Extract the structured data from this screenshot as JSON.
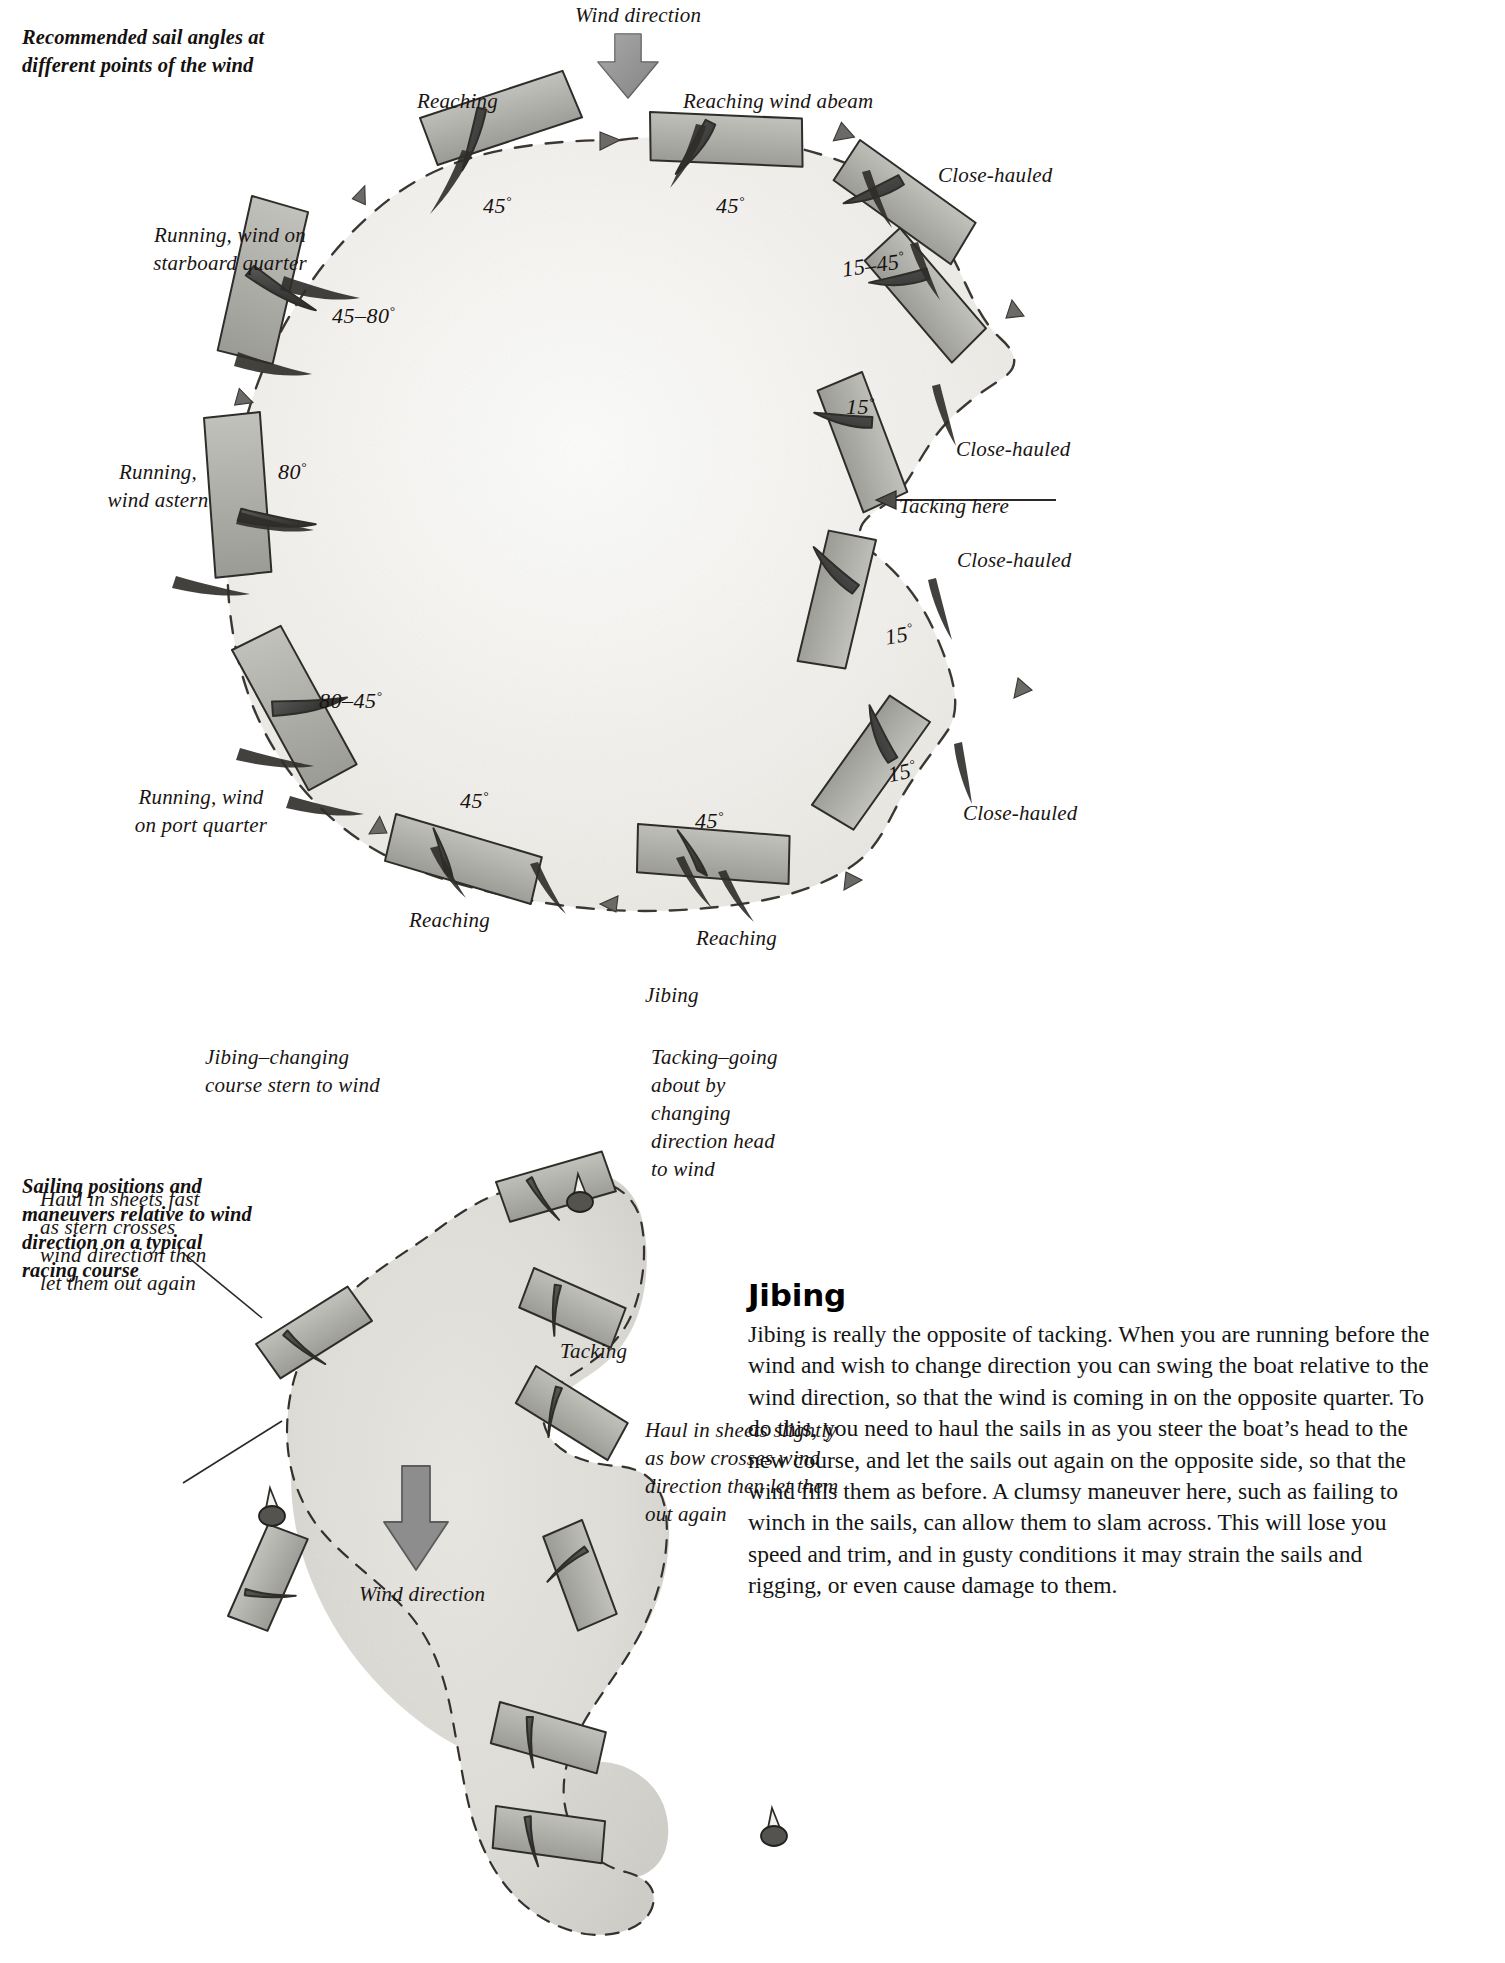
{
  "page": {
    "background": "#ffffff",
    "ink": "#1a1512",
    "sail_fill": "#9a9a9a",
    "hull_fill": "#b9b9b4",
    "arrow_fill": "#8e8e8e"
  },
  "figure1": {
    "caption": "Recommended sail angles at different points of the wind",
    "wind_label": "Wind direction",
    "labels": [
      {
        "key": "reaching_top_left",
        "text": "Reaching",
        "x": 417,
        "y": 87,
        "align": "left"
      },
      {
        "key": "reaching_wind_abeam",
        "text": "Reaching wind abeam",
        "x": 683,
        "y": 87,
        "align": "left"
      },
      {
        "key": "close_hauled_ne",
        "text": "Close-hauled",
        "x": 938,
        "y": 161,
        "align": "left"
      },
      {
        "key": "running_starboard",
        "text": "Running, wind on\nstarboard quarter",
        "x": 120,
        "y": 221,
        "align": "left"
      },
      {
        "key": "close_hauled_e",
        "text": "Close-hauled",
        "x": 956,
        "y": 435,
        "align": "left"
      },
      {
        "key": "tacking_here",
        "text": "Tacking here",
        "x": 899,
        "y": 492,
        "align": "left"
      },
      {
        "key": "close_hauled_se",
        "text": "Close-hauled",
        "x": 957,
        "y": 546,
        "align": "left"
      },
      {
        "key": "running_wind_astern",
        "text": "Running,\nwind astern",
        "x": 83,
        "y": 458,
        "align": "left"
      },
      {
        "key": "running_port",
        "text": "Running, wind\non port quarter",
        "x": 106,
        "y": 783,
        "align": "left"
      },
      {
        "key": "close_hauled_s",
        "text": "Close-hauled",
        "x": 963,
        "y": 799,
        "align": "left"
      },
      {
        "key": "reaching_bottom_left",
        "text": "Reaching",
        "x": 409,
        "y": 906,
        "align": "left"
      },
      {
        "key": "reaching_bottom_right",
        "text": "Reaching",
        "x": 696,
        "y": 924,
        "align": "left"
      }
    ],
    "angles": [
      {
        "key": "a45_top_left",
        "text": "45",
        "unit": "°",
        "x": 483,
        "y": 193
      },
      {
        "key": "a45_top_right",
        "text": "45",
        "unit": "°",
        "x": 716,
        "y": 193
      },
      {
        "key": "a15_45_ne",
        "text": "15–45",
        "unit": "°",
        "x": 842,
        "y": 252
      },
      {
        "key": "a45_80",
        "text": "45–80",
        "unit": "°",
        "x": 332,
        "y": 303
      },
      {
        "key": "a15_e",
        "text": "15",
        "unit": "°",
        "x": 846,
        "y": 394
      },
      {
        "key": "a80",
        "text": "80",
        "unit": "°",
        "x": 278,
        "y": 459
      },
      {
        "key": "a15_se",
        "text": "15",
        "unit": "°",
        "x": 885,
        "y": 622
      },
      {
        "key": "a80_45",
        "text": "80–45",
        "unit": "°",
        "x": 319,
        "y": 688
      },
      {
        "key": "a15_s",
        "text": "15",
        "unit": "°",
        "x": 888,
        "y": 759
      },
      {
        "key": "a45_bot_left",
        "text": "45",
        "unit": "°",
        "x": 460,
        "y": 788
      },
      {
        "key": "a45_bot_right",
        "text": "45",
        "unit": "°",
        "x": 695,
        "y": 808
      }
    ]
  },
  "figure2": {
    "caption": "Sailing positions and maneuvers relative to wind direction on a typical racing course",
    "wind_label": "Wind direction",
    "labels": [
      {
        "key": "jibing",
        "text": "Jibing",
        "x": 645,
        "y": 981,
        "align": "left"
      },
      {
        "key": "jibing_change",
        "text": "Jibing–changing\ncourse stern to wind",
        "x": 205,
        "y": 1043,
        "align": "left"
      },
      {
        "key": "tacking_going",
        "text": "Tacking–going\nabout by\nchanging\ndirection head\nto wind",
        "x": 651,
        "y": 1043,
        "align": "left"
      },
      {
        "key": "haul_fast",
        "text": "Haul in sheets fast\nas stern crosses\nwind direction then\nlet them out again",
        "x": 40,
        "y": 1185,
        "align": "left"
      },
      {
        "key": "tacking",
        "text": "Tacking",
        "x": 560,
        "y": 1337,
        "align": "left"
      },
      {
        "key": "haul_slightly",
        "text": "Haul in sheets slightly\nas bow crosses wind\ndirection then let them\nout again",
        "x": 645,
        "y": 1416,
        "align": "left"
      }
    ]
  },
  "article": {
    "heading": "Jibing",
    "body": "Jibing is really the opposite of tacking. When you are running before the wind and wish to change direction you can swing the boat relative to the wind direction, so that the wind is coming in on the opposite quarter. To do this, you need to haul the sails in as you steer the boat’s head to the new course, and let the sails out again on the opposite side, so that the wind fills them as before. A clumsy maneuver here, such as failing to winch in the sails, can allow them to slam across. This will lose you speed and trim, and in gusty conditions it may strain the sails and rigging, or even cause damage to them."
  }
}
